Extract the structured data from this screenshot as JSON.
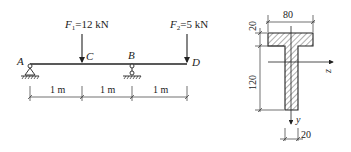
{
  "beam": {
    "points": {
      "A": "A",
      "B": "B",
      "C": "C",
      "D": "D"
    },
    "loads": [
      {
        "symbol": "F",
        "sub": "1",
        "value": "=12 kN"
      },
      {
        "symbol": "F",
        "sub": "2",
        "value": "=5 kN"
      }
    ],
    "spans": [
      "1 m",
      "1 m",
      "1 m"
    ]
  },
  "section": {
    "dims": {
      "flange_width": "80",
      "flange_thickness": "20",
      "web_height": "120",
      "web_width": "20"
    },
    "axes": {
      "z": "z",
      "y": "y"
    }
  },
  "colors": {
    "line": "#222222",
    "background": "#ffffff"
  }
}
